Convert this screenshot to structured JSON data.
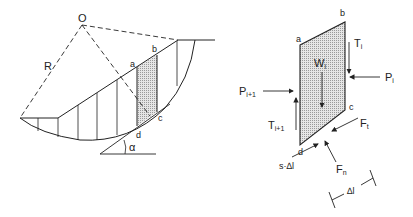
{
  "left_figure": {
    "center_label": "O",
    "radius_label": "R",
    "point_labels": {
      "a": "a",
      "b": "b",
      "c": "c",
      "d": "d"
    },
    "angle_label": "α"
  },
  "right_figure": {
    "point_labels": {
      "a": "a",
      "b": "b",
      "c": "c",
      "d": "d"
    },
    "weight": {
      "main": "W",
      "sub": "i"
    },
    "T_i": {
      "main": "T",
      "sub": "i"
    },
    "P_i": {
      "main": "P",
      "sub": "i"
    },
    "P_i1": {
      "main": "P",
      "sub": "i+1"
    },
    "T_i1": {
      "main": "T",
      "sub": "i+1"
    },
    "F_t": {
      "main": "F",
      "sub": "t"
    },
    "F_n": {
      "main": "F",
      "sub": "n"
    },
    "s_dl": "s·∆l",
    "dl": "∆l"
  },
  "colors": {
    "line": "#222222",
    "shade": "#cfcfcf"
  }
}
